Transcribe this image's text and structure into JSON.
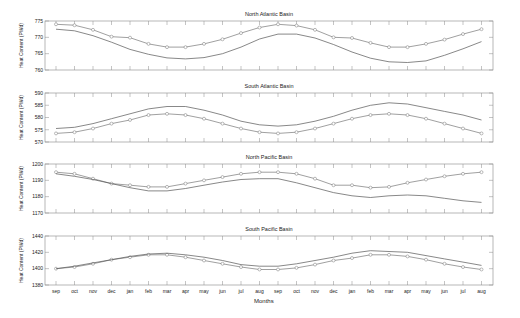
{
  "figure": {
    "xlabel": "Months",
    "ylabel": "Heat Content (PWd)",
    "months": [
      "sep",
      "oct",
      "nov",
      "dec",
      "jan",
      "feb",
      "mar",
      "apr",
      "may",
      "jun",
      "jul",
      "aug",
      "sep",
      "oct",
      "nov",
      "dec",
      "jan",
      "feb",
      "mar",
      "apr",
      "may",
      "jun",
      "jul",
      "aug"
    ],
    "colors": {
      "line": "#555555",
      "marker_line": "#777777",
      "axis": "#444444",
      "text": "#222222"
    }
  },
  "chart_data": [
    {
      "type": "line",
      "title": "North Atlantic Basin",
      "xlabel": "",
      "ylabel": "Heat Content (PWd)",
      "ylim": [
        760,
        775
      ],
      "yticks": [
        760,
        765,
        770,
        775
      ],
      "categories": [
        "sep",
        "oct",
        "nov",
        "dec",
        "jan",
        "feb",
        "mar",
        "apr",
        "may",
        "jun",
        "jul",
        "aug",
        "sep",
        "oct",
        "nov",
        "dec",
        "jan",
        "feb",
        "mar",
        "apr",
        "may",
        "jun",
        "jul",
        "aug"
      ],
      "series": [
        {
          "name": "with markers",
          "marker": "circle",
          "values": [
            774.0,
            773.7,
            772.3,
            770.2,
            769.9,
            768.0,
            767.0,
            767.0,
            768.0,
            769.4,
            771.3,
            773.0,
            774.0,
            773.6,
            772.3,
            770.0,
            769.8,
            768.3,
            767.0,
            767.0,
            768.0,
            769.3,
            771.0,
            772.5
          ]
        },
        {
          "name": "plain",
          "marker": "none",
          "values": [
            772.5,
            772.0,
            770.5,
            768.5,
            766.3,
            764.8,
            763.7,
            763.4,
            763.8,
            765.0,
            767.0,
            769.5,
            771.0,
            771.0,
            769.8,
            767.8,
            765.5,
            763.6,
            762.5,
            762.3,
            762.8,
            764.5,
            766.5,
            768.7
          ]
        }
      ]
    },
    {
      "type": "line",
      "title": "South Atlantic Basin",
      "xlabel": "",
      "ylabel": "Heat Content (PWd)",
      "ylim": [
        570,
        590
      ],
      "yticks": [
        570,
        575,
        580,
        585,
        590
      ],
      "categories": [
        "sep",
        "oct",
        "nov",
        "dec",
        "jan",
        "feb",
        "mar",
        "apr",
        "may",
        "jun",
        "jul",
        "aug",
        "sep",
        "oct",
        "nov",
        "dec",
        "jan",
        "feb",
        "mar",
        "apr",
        "may",
        "jun",
        "jul",
        "aug"
      ],
      "series": [
        {
          "name": "with markers",
          "marker": "circle",
          "values": [
            573.5,
            574.0,
            575.5,
            577.5,
            579.0,
            581.0,
            581.5,
            581.0,
            579.5,
            577.5,
            575.5,
            574.0,
            573.5,
            574.0,
            575.5,
            577.5,
            579.5,
            581.0,
            581.5,
            581.0,
            579.5,
            577.5,
            575.5,
            573.5
          ]
        },
        {
          "name": "plain",
          "marker": "none",
          "values": [
            575.5,
            576.0,
            577.5,
            579.5,
            581.5,
            583.5,
            584.5,
            584.5,
            583.0,
            581.0,
            578.5,
            577.0,
            576.5,
            577.0,
            578.5,
            580.5,
            583.0,
            585.0,
            586.0,
            585.5,
            584.0,
            582.5,
            581.0,
            579.0
          ]
        }
      ]
    },
    {
      "type": "line",
      "title": "North Pacific Basin",
      "xlabel": "",
      "ylabel": "Heat Content (PWd)",
      "ylim": [
        1170,
        1200
      ],
      "yticks": [
        1170,
        1180,
        1190,
        1200
      ],
      "categories": [
        "sep",
        "oct",
        "nov",
        "dec",
        "jan",
        "feb",
        "mar",
        "apr",
        "may",
        "jun",
        "jul",
        "aug",
        "sep",
        "oct",
        "nov",
        "dec",
        "jan",
        "feb",
        "mar",
        "apr",
        "may",
        "jun",
        "jul",
        "aug"
      ],
      "series": [
        {
          "name": "with markers",
          "marker": "circle",
          "values": [
            1195.0,
            1194.0,
            1191.0,
            1188.0,
            1187.0,
            1186.0,
            1186.0,
            1188.0,
            1190.0,
            1192.0,
            1194.0,
            1195.0,
            1195.0,
            1194.0,
            1191.0,
            1187.0,
            1187.0,
            1185.5,
            1186.0,
            1188.5,
            1190.5,
            1192.5,
            1194.0,
            1195.0
          ]
        },
        {
          "name": "plain",
          "marker": "none",
          "values": [
            1194.0,
            1192.5,
            1190.5,
            1188.0,
            1185.5,
            1183.5,
            1183.5,
            1185.0,
            1187.0,
            1189.0,
            1190.5,
            1191.0,
            1191.0,
            1188.5,
            1185.5,
            1182.5,
            1180.5,
            1179.5,
            1180.5,
            1181.0,
            1180.5,
            1179.0,
            1177.5,
            1176.5
          ]
        }
      ]
    },
    {
      "type": "line",
      "title": "South Pacific Basin",
      "xlabel": "Months",
      "ylabel": "Heat Content (PWd)",
      "ylim": [
        1380,
        1440
      ],
      "yticks": [
        1380,
        1400,
        1420,
        1440
      ],
      "categories": [
        "sep",
        "oct",
        "nov",
        "dec",
        "jan",
        "feb",
        "mar",
        "apr",
        "may",
        "jun",
        "jul",
        "aug",
        "sep",
        "oct",
        "nov",
        "dec",
        "jan",
        "feb",
        "mar",
        "apr",
        "may",
        "jun",
        "jul",
        "aug"
      ],
      "series": [
        {
          "name": "with markers",
          "marker": "circle",
          "values": [
            1400,
            1402,
            1406,
            1411,
            1414,
            1417,
            1417,
            1414,
            1410,
            1406,
            1402,
            1399,
            1399,
            1401,
            1405,
            1410,
            1413,
            1417,
            1417,
            1415,
            1411,
            1406,
            1402,
            1399
          ]
        },
        {
          "name": "plain",
          "marker": "none",
          "values": [
            1400,
            1403,
            1407,
            1411,
            1415,
            1418,
            1419,
            1417,
            1414,
            1410,
            1405,
            1403,
            1403,
            1406,
            1410,
            1414,
            1419,
            1422,
            1421,
            1420,
            1416,
            1412,
            1408,
            1404
          ]
        }
      ]
    }
  ]
}
